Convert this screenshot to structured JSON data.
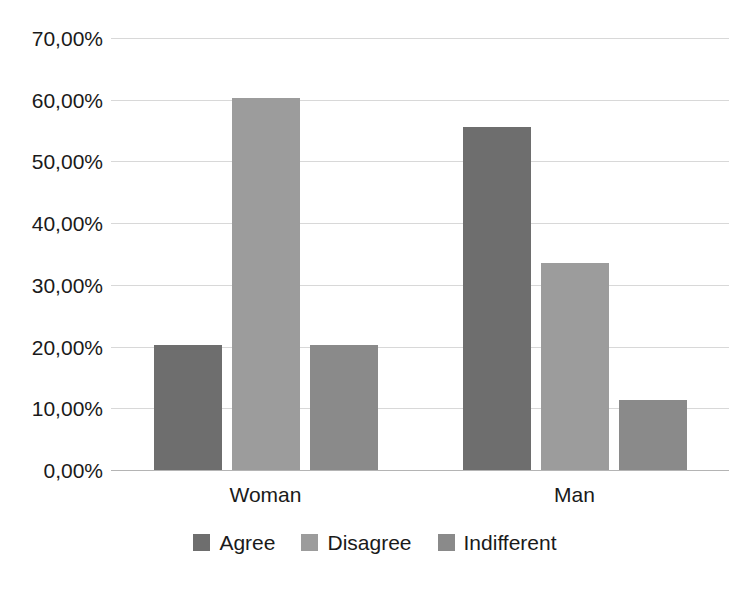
{
  "chart_data": {
    "type": "bar",
    "title": "",
    "xlabel": "",
    "ylabel": "",
    "categories": [
      "Woman",
      "Man"
    ],
    "series": [
      {
        "name": "Agree",
        "color": "#6e6e6e",
        "values": [
          20.2,
          55.5
        ]
      },
      {
        "name": "Disagree",
        "color": "#9c9c9c",
        "values": [
          60.2,
          33.5
        ]
      },
      {
        "name": "Indifferent",
        "color": "#8a8a8a",
        "values": [
          20.2,
          11.4
        ]
      }
    ],
    "ylim": [
      0,
      70
    ],
    "ytick_values": [
      0,
      10,
      20,
      30,
      40,
      50,
      60,
      70
    ],
    "ytick_labels": [
      "0,00%",
      "10,00%",
      "20,00%",
      "30,00%",
      "40,00%",
      "50,00%",
      "60,00%",
      "70,00%"
    ],
    "grid": true,
    "legend_position": "bottom",
    "value_format": "percent-comma-decimal"
  },
  "axis": {
    "y_labels": [
      "70,00%",
      "60,00%",
      "50,00%",
      "40,00%",
      "30,00%",
      "20,00%",
      "10,00%",
      "0,00%"
    ],
    "x_labels": [
      "Woman",
      "Man"
    ]
  },
  "legend": {
    "items": [
      {
        "label": "Agree",
        "color": "#6e6e6e"
      },
      {
        "label": "Disagree",
        "color": "#9c9c9c"
      },
      {
        "label": "Indifferent",
        "color": "#8a8a8a"
      }
    ]
  },
  "colors": {
    "gridline": "#d8d8d8",
    "axisline": "#b4b4b4",
    "text": "#1a1a1a",
    "background": "#ffffff"
  }
}
